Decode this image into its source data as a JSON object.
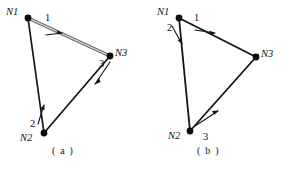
{
  "figure": {
    "background_color": "#ffffff",
    "ink_color": "#111111",
    "highlight_edge_color": "#6d6d6d",
    "panels": [
      {
        "id": "panel-a",
        "caption": "( a )",
        "nodes": [
          {
            "id": "N1",
            "label": "N1",
            "x": 28,
            "y": 18,
            "label_x": 6,
            "label_y": 15
          },
          {
            "id": "N2",
            "label": "N2",
            "x": 44,
            "y": 133,
            "label_x": 20,
            "label_y": 141
          },
          {
            "id": "N3",
            "label": "N3",
            "x": 110,
            "y": 56,
            "label_x": 115,
            "label_y": 56
          }
        ],
        "edges": [
          {
            "id": "edge-1",
            "label": "1",
            "from": "N1",
            "to": "N3",
            "direction": "N1 to N3",
            "style": "double",
            "label_x": 45,
            "label_y": 21,
            "arrow_t": 0.34,
            "arrow_side": "below"
          },
          {
            "id": "edge-2",
            "label": "2",
            "from": "N2",
            "to": "N1",
            "direction": "N2 to N1",
            "style": "single",
            "label_x": 30,
            "label_y": 127,
            "arrow_t": 0.24,
            "arrow_side": "right"
          },
          {
            "id": "edge-3",
            "label": "3",
            "from": "N3",
            "to": "N2",
            "direction": "N3 to N2",
            "style": "single",
            "label_x": 99,
            "label_y": 67,
            "arrow_t": 0.22,
            "arrow_side": "left"
          }
        ]
      },
      {
        "id": "panel-b",
        "caption": "( b )",
        "nodes": [
          {
            "id": "N1",
            "label": "N1",
            "x": 179,
            "y": 18,
            "label_x": 157,
            "label_y": 15
          },
          {
            "id": "N2",
            "label": "N2",
            "x": 190,
            "y": 131,
            "label_x": 168,
            "label_y": 139
          },
          {
            "id": "N3",
            "label": "N3",
            "x": 256,
            "y": 57,
            "label_x": 261,
            "label_y": 57
          }
        ],
        "edges": [
          {
            "id": "edge-1",
            "label": "1",
            "from": "N1",
            "to": "N3",
            "direction": "N1 to N3",
            "style": "single",
            "label_x": 194,
            "label_y": 21,
            "arrow_t": 0.35,
            "arrow_side": "below"
          },
          {
            "id": "edge-2",
            "label": "2",
            "from": "N1",
            "to": "N2",
            "direction": "N1 to N2",
            "style": "single",
            "label_x": 167,
            "label_y": 31,
            "arrow_t": 0.22,
            "arrow_side": "left"
          },
          {
            "id": "edge-3",
            "label": "3",
            "from": "N2",
            "to": "N3",
            "direction": "N2 to N3",
            "style": "single",
            "label_x": 203,
            "label_y": 140,
            "arrow_t": 0.3,
            "arrow_side": "left"
          }
        ]
      }
    ],
    "bottom_caption": ""
  }
}
